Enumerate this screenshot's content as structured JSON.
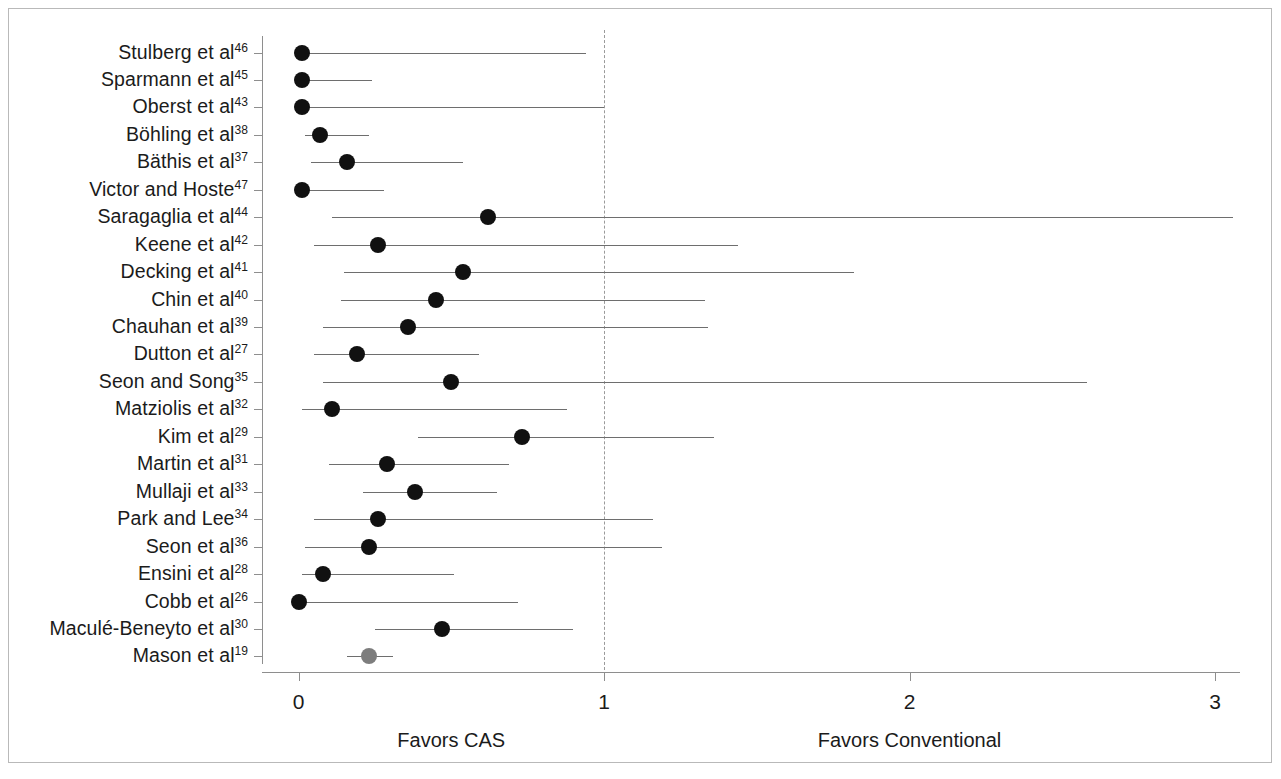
{
  "chart_data": {
    "type": "scatter",
    "subtype": "forest-plot",
    "title": "",
    "xlabel": "",
    "ylabel": "",
    "xlim": [
      -0.12,
      3.2
    ],
    "xticks": [
      0,
      1,
      2,
      3
    ],
    "xtick_labels": [
      "0",
      "1",
      "2",
      "3"
    ],
    "null_value": 1,
    "null_line_style": "dash-dot",
    "grid": false,
    "legend": false,
    "direction_labels": [
      {
        "text": "Favors CAS",
        "at_x": 0.5
      },
      {
        "text": "Favors Conventional",
        "at_x": 2.0
      }
    ],
    "marker_colors": {
      "default": "#111111",
      "pooled": "#7d7d7d"
    },
    "categories": [
      "Stulberg et al46",
      "Sparmann et al45",
      "Oberst et al43",
      "Böhling et al38",
      "Bäthis et al37",
      "Victor and Hoste47",
      "Saragaglia et al44",
      "Keene et al42",
      "Decking et al41",
      "Chin et al40",
      "Chauhan et al39",
      "Dutton et al27",
      "Seon and Song35",
      "Matziolis et al32",
      "Kim et al29",
      "Martin et al31",
      "Mullaji et al33",
      "Park and Lee34",
      "Seon et al36",
      "Ensini et al28",
      "Cobb et al26",
      "Maculé-Beneyto et al30",
      "Mason et al19"
    ],
    "rows": [
      {
        "name": "Stulberg et al",
        "ref": "46",
        "estimate": 0.01,
        "ci_low": 0.01,
        "ci_high": 0.94,
        "marker": "default"
      },
      {
        "name": "Sparmann et al",
        "ref": "45",
        "estimate": 0.01,
        "ci_low": 0.01,
        "ci_high": 0.24,
        "marker": "default"
      },
      {
        "name": "Oberst et al",
        "ref": "43",
        "estimate": 0.01,
        "ci_low": 0.01,
        "ci_high": 1.0,
        "marker": "default"
      },
      {
        "name": "Böhling et al",
        "ref": "38",
        "estimate": 0.07,
        "ci_low": 0.02,
        "ci_high": 0.23,
        "marker": "default"
      },
      {
        "name": "Bäthis et al",
        "ref": "37",
        "estimate": 0.16,
        "ci_low": 0.04,
        "ci_high": 0.54,
        "marker": "default"
      },
      {
        "name": "Victor and Hoste",
        "ref": "47",
        "estimate": 0.01,
        "ci_low": 0.01,
        "ci_high": 0.28,
        "marker": "default"
      },
      {
        "name": "Saragaglia et al",
        "ref": "44",
        "estimate": 0.62,
        "ci_low": 0.11,
        "ci_high": 3.06,
        "marker": "default"
      },
      {
        "name": "Keene et al",
        "ref": "42",
        "estimate": 0.26,
        "ci_low": 0.05,
        "ci_high": 1.44,
        "marker": "default"
      },
      {
        "name": "Decking et al",
        "ref": "41",
        "estimate": 0.54,
        "ci_low": 0.15,
        "ci_high": 1.82,
        "marker": "default"
      },
      {
        "name": "Chin et al",
        "ref": "40",
        "estimate": 0.45,
        "ci_low": 0.14,
        "ci_high": 1.33,
        "marker": "default"
      },
      {
        "name": "Chauhan et al",
        "ref": "39",
        "estimate": 0.36,
        "ci_low": 0.08,
        "ci_high": 1.34,
        "marker": "default"
      },
      {
        "name": "Dutton et al",
        "ref": "27",
        "estimate": 0.19,
        "ci_low": 0.05,
        "ci_high": 0.59,
        "marker": "default"
      },
      {
        "name": "Seon and Song",
        "ref": "35",
        "estimate": 0.5,
        "ci_low": 0.08,
        "ci_high": 2.58,
        "marker": "default"
      },
      {
        "name": "Matziolis et al",
        "ref": "32",
        "estimate": 0.11,
        "ci_low": 0.01,
        "ci_high": 0.88,
        "marker": "default"
      },
      {
        "name": "Kim et al",
        "ref": "29",
        "estimate": 0.73,
        "ci_low": 0.39,
        "ci_high": 1.36,
        "marker": "default"
      },
      {
        "name": "Martin et al",
        "ref": "31",
        "estimate": 0.29,
        "ci_low": 0.1,
        "ci_high": 0.69,
        "marker": "default"
      },
      {
        "name": "Mullaji et al",
        "ref": "33",
        "estimate": 0.38,
        "ci_low": 0.21,
        "ci_high": 0.65,
        "marker": "default"
      },
      {
        "name": "Park and Lee",
        "ref": "34",
        "estimate": 0.26,
        "ci_low": 0.05,
        "ci_high": 1.16,
        "marker": "default"
      },
      {
        "name": "Seon et al",
        "ref": "36",
        "estimate": 0.23,
        "ci_low": 0.02,
        "ci_high": 1.19,
        "marker": "default"
      },
      {
        "name": "Ensini et al",
        "ref": "28",
        "estimate": 0.08,
        "ci_low": 0.01,
        "ci_high": 0.51,
        "marker": "default"
      },
      {
        "name": "Cobb et al",
        "ref": "26",
        "estimate": 0.0,
        "ci_low": 0.0,
        "ci_high": 0.72,
        "marker": "default"
      },
      {
        "name": "Maculé-Beneyto et al",
        "ref": "30",
        "estimate": 0.47,
        "ci_low": 0.25,
        "ci_high": 0.9,
        "marker": "default"
      },
      {
        "name": "Mason et al",
        "ref": "19",
        "estimate": 0.23,
        "ci_low": 0.16,
        "ci_high": 0.31,
        "marker": "pooled"
      }
    ]
  }
}
